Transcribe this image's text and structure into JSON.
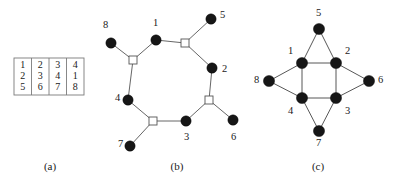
{
  "figure": {
    "panels": [
      {
        "id": "a",
        "caption": "(a)",
        "caption_x": 50,
        "caption_y": 170,
        "type": "table"
      },
      {
        "id": "b",
        "caption": "(b)",
        "caption_x": 177,
        "caption_y": 170,
        "type": "graph"
      },
      {
        "id": "c",
        "caption": "(c)",
        "caption_x": 318,
        "caption_y": 170,
        "type": "graph"
      }
    ]
  },
  "panel_a": {
    "name": "adjacency-table",
    "columns": [
      {
        "cells": [
          "1",
          "2",
          "5"
        ]
      },
      {
        "cells": [
          "2",
          "3",
          "6"
        ]
      },
      {
        "cells": [
          "3",
          "4",
          "7"
        ]
      },
      {
        "cells": [
          "4",
          "1",
          "8"
        ]
      }
    ],
    "geometry": {
      "x": 14,
      "y": 58,
      "width": 70,
      "height": 37,
      "col_width": 17.5,
      "row_y": [
        68,
        79,
        90
      ]
    }
  },
  "panel_b": {
    "name": "octagon-graph",
    "circle_radius": 5.2,
    "square_size": 8,
    "circles": [
      {
        "id": "8",
        "cx": 111,
        "cy": 43,
        "label": "8",
        "lx": 103,
        "ly": 28
      },
      {
        "id": "1",
        "cx": 156,
        "cy": 40,
        "label": "1",
        "lx": 153,
        "ly": 26
      },
      {
        "id": "5",
        "cx": 211,
        "cy": 19,
        "label": "5",
        "lx": 220,
        "ly": 18
      },
      {
        "id": "2",
        "cx": 212,
        "cy": 68,
        "label": "2",
        "lx": 222,
        "ly": 72
      },
      {
        "id": "6",
        "cx": 233,
        "cy": 120,
        "label": "6",
        "lx": 231,
        "ly": 140
      },
      {
        "id": "3",
        "cx": 186,
        "cy": 121,
        "label": "3",
        "lx": 184,
        "ly": 140
      },
      {
        "id": "7",
        "cx": 130,
        "cy": 146,
        "label": "7",
        "lx": 118,
        "ly": 147
      },
      {
        "id": "4",
        "cx": 128,
        "cy": 100,
        "label": "4",
        "lx": 115,
        "ly": 101
      }
    ],
    "squares": [
      {
        "id": "s1",
        "cx": 133,
        "cy": 60
      },
      {
        "id": "s2",
        "cx": 185,
        "cy": 43
      },
      {
        "id": "s3",
        "cx": 209,
        "cy": 100
      },
      {
        "id": "s4",
        "cx": 153,
        "cy": 121
      }
    ],
    "edges": [
      {
        "from": "8",
        "to": "s1"
      },
      {
        "from": "1",
        "to": "s1"
      },
      {
        "from": "4",
        "to": "s1"
      },
      {
        "from": "1",
        "to": "s2"
      },
      {
        "from": "5",
        "to": "s2"
      },
      {
        "from": "2",
        "to": "s2"
      },
      {
        "from": "2",
        "to": "s3"
      },
      {
        "from": "6",
        "to": "s3"
      },
      {
        "from": "3",
        "to": "s3"
      },
      {
        "from": "3",
        "to": "s4"
      },
      {
        "from": "7",
        "to": "s4"
      },
      {
        "from": "4",
        "to": "s4"
      }
    ]
  },
  "panel_c": {
    "name": "star-square-graph",
    "circle_radius": 5.6,
    "circles": [
      {
        "id": "5",
        "cx": 319,
        "cy": 29,
        "label": "5",
        "lx": 316,
        "ly": 16
      },
      {
        "id": "1",
        "cx": 302,
        "cy": 63,
        "label": "1",
        "lx": 288,
        "ly": 54
      },
      {
        "id": "2",
        "cx": 336,
        "cy": 63,
        "label": "2",
        "lx": 345,
        "ly": 54
      },
      {
        "id": "8",
        "cx": 269,
        "cy": 81,
        "label": "8",
        "lx": 254,
        "ly": 83
      },
      {
        "id": "6",
        "cx": 369,
        "cy": 81,
        "label": "6",
        "lx": 378,
        "ly": 83
      },
      {
        "id": "4",
        "cx": 302,
        "cy": 98,
        "label": "4",
        "lx": 288,
        "ly": 114
      },
      {
        "id": "3",
        "cx": 336,
        "cy": 98,
        "label": "3",
        "lx": 345,
        "ly": 114
      },
      {
        "id": "7",
        "cx": 319,
        "cy": 131,
        "label": "7",
        "lx": 316,
        "ly": 146
      }
    ],
    "edges": [
      {
        "from": "1",
        "to": "2"
      },
      {
        "from": "2",
        "to": "3"
      },
      {
        "from": "3",
        "to": "4"
      },
      {
        "from": "4",
        "to": "1"
      },
      {
        "from": "5",
        "to": "1"
      },
      {
        "from": "5",
        "to": "2"
      },
      {
        "from": "6",
        "to": "2"
      },
      {
        "from": "6",
        "to": "3"
      },
      {
        "from": "7",
        "to": "3"
      },
      {
        "from": "7",
        "to": "4"
      },
      {
        "from": "8",
        "to": "4"
      },
      {
        "from": "8",
        "to": "1"
      }
    ]
  },
  "colors": {
    "vertex_fill": "#161616",
    "edge_stroke": "#555555",
    "table_stroke": "#7a7a7a",
    "text": "#1a1a1a",
    "background": "#ffffff"
  }
}
